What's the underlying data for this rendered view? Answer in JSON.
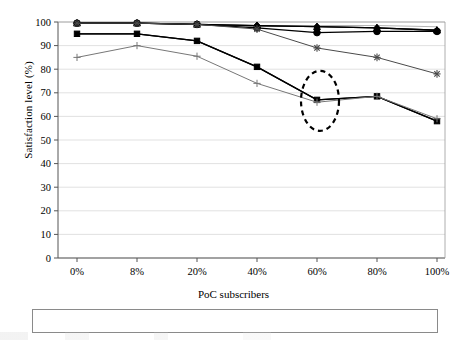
{
  "chart_data": {
    "type": "line",
    "title": "",
    "xlabel": "PoC subscribers",
    "ylabel": "Satisfaction level (%)",
    "categories": [
      "0%",
      "8%",
      "20%",
      "40%",
      "60%",
      "80%",
      "100%"
    ],
    "ylim": [
      0,
      100
    ],
    "yticks": [
      0,
      10,
      20,
      30,
      40,
      50,
      60,
      70,
      80,
      90,
      100
    ],
    "grid": true,
    "legend_position": "bottom",
    "series": [
      {
        "name": "Speech",
        "marker": "diamond",
        "color": "#000000",
        "values": [
          99.5,
          99.5,
          99.0,
          98.5,
          98.0,
          97.5,
          96.5
        ]
      },
      {
        "name": "Video",
        "marker": "square",
        "color": "#000000",
        "values": [
          95.0,
          95.0,
          92.0,
          81.0,
          67.0,
          68.5,
          58.0
        ]
      },
      {
        "name": "RTVS",
        "marker": "triangle",
        "color": "#000000",
        "values": [
          99.5,
          99.5,
          99.0,
          98.5,
          98.0,
          97.5,
          96.5
        ]
      },
      {
        "name": "PoC",
        "marker": "none",
        "color": "#b5b5b5",
        "values": [
          99.5,
          99.5,
          99.0,
          98.0,
          98.5,
          98.5,
          98.0
        ]
      },
      {
        "name": "Streaming",
        "marker": "asterisk",
        "color": "#4a4a4a",
        "values": [
          99.5,
          99.5,
          99.0,
          97.0,
          89.0,
          85.0,
          78.0
        ]
      },
      {
        "name": "MMS",
        "marker": "circle",
        "color": "#000000",
        "values": [
          99.5,
          99.5,
          99.0,
          97.5,
          95.5,
          96.0,
          96.0
        ]
      },
      {
        "name": "Dialup",
        "marker": "plus",
        "color": "#777777",
        "values": [
          85.0,
          90.0,
          85.5,
          74.0,
          66.0,
          68.5,
          59.0
        ]
      },
      {
        "name": "WAP",
        "marker": "none",
        "color": "#000000",
        "values": [
          95.0,
          95.0,
          92.0,
          81.0,
          67.0,
          68.5,
          58.0
        ]
      }
    ],
    "annotations": [
      {
        "type": "ellipse",
        "style": "dashed",
        "cx_category": "60%",
        "cy_value": 67,
        "rx_value_span": 8,
        "ry_value_span": 13
      }
    ]
  },
  "axis": {
    "y_title": "Satisfaction level (%)",
    "x_title": "PoC subscribers",
    "y_ticks": [
      "100",
      "90",
      "80",
      "70",
      "60",
      "50",
      "40",
      "30",
      "20",
      "10",
      "0"
    ],
    "x_ticks": [
      "0%",
      "8%",
      "20%",
      "40%",
      "60%",
      "80%",
      "100%"
    ]
  },
  "legend": {
    "items": [
      {
        "label": "Speech",
        "marker": "diamond"
      },
      {
        "label": "Video",
        "marker": "square"
      },
      {
        "label": "RTVS",
        "marker": "triangle"
      },
      {
        "label": "PoC",
        "marker": "none-light"
      },
      {
        "label": "Streaming",
        "marker": "asterisk"
      },
      {
        "label": "MMS",
        "marker": "circle"
      },
      {
        "label": "Dialup",
        "marker": "plus"
      },
      {
        "label": "WAP",
        "marker": "none-dark"
      }
    ]
  }
}
